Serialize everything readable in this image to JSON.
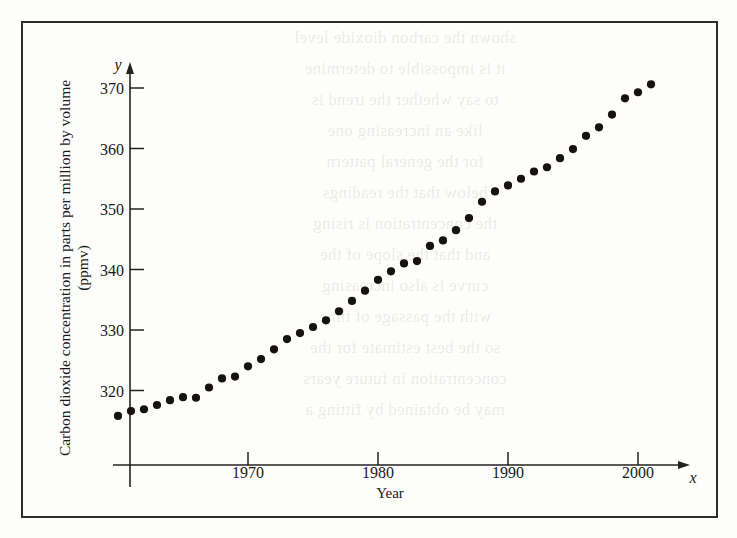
{
  "figure": {
    "frame_color": "#2e2c2b",
    "background": "#fdfdfb",
    "ghost_text": "shown the carbon dioxide level\nit is impossible to determine\nto say whether the trend is\nlike an increasing one\nfor the general pattern\nbelow that the readings\nthe concentration is rising\nand that the slope of the\ncurve is also increasing\nwith the passage of time\nso the best estimate for the\nconcentration in future years\nmay be obtained by fitting a"
  },
  "chart_data": {
    "type": "scatter",
    "title": "",
    "xlabel": "Year",
    "ylabel": "Carbon dioxide concentration in parts per million by volume (ppmv)",
    "ylabel_line1": "Carbon dioxide concentration in parts per million by volume",
    "ylabel_line2": "(ppmv)",
    "x_axis_name": "x",
    "y_axis_name": "y",
    "xticks": [
      1970,
      1980,
      1990,
      2000
    ],
    "yticks": [
      320,
      330,
      340,
      350,
      360,
      370
    ],
    "xlim": [
      1958.5,
      2003.5
    ],
    "ylim": [
      312.0,
      373.5
    ],
    "grid": false,
    "legend": null,
    "marker": "filled-circle",
    "marker_color": "#16130f",
    "x": [
      1960,
      1961,
      1962,
      1963,
      1964,
      1965,
      1966,
      1967,
      1968,
      1969,
      1970,
      1971,
      1972,
      1973,
      1974,
      1975,
      1976,
      1977,
      1978,
      1979,
      1980,
      1981,
      1982,
      1983,
      1984,
      1985,
      1986,
      1987,
      1988,
      1989,
      1990,
      1991,
      1992,
      1993,
      1994,
      1995,
      1996,
      1997,
      1998,
      1999,
      2000,
      2001
    ],
    "y": [
      315.8,
      316.6,
      316.9,
      317.6,
      318.4,
      318.9,
      318.8,
      320.5,
      322.0,
      322.3,
      324.0,
      325.2,
      326.8,
      328.5,
      329.5,
      330.5,
      331.6,
      333.1,
      334.8,
      336.5,
      338.3,
      339.7,
      341.0,
      341.4,
      343.9,
      344.8,
      346.5,
      348.5,
      351.2,
      352.9,
      353.9,
      355.0,
      356.2,
      356.9,
      358.4,
      359.9,
      362.1,
      363.5,
      365.6,
      368.3,
      369.3,
      370.6
    ]
  }
}
